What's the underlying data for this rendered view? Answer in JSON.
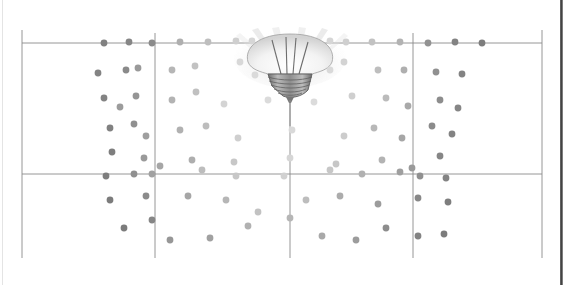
{
  "figure": {
    "kind": "scanned-diagram",
    "caption_text": "",
    "background_color": "#ffffff",
    "ink_color": "#6b6b6b",
    "grid": {
      "line_color": "#8a8a8a",
      "x_lines": [
        22,
        155,
        290,
        413,
        542
      ],
      "y_lines": [
        43,
        174,
        258
      ],
      "left": 22,
      "right": 542,
      "top": 43,
      "bottom": 258
    },
    "lamp": {
      "name": "light-bulb",
      "orientation": "inverted",
      "center_x": 290,
      "glass_top_y": 33,
      "base_top_y": 72,
      "base_bottom_y": 96,
      "stem_bottom_y": 124,
      "glass_color": "#d8d8d8",
      "base_color": "#8f8f8f",
      "ray_color": "#c9c9c9",
      "ray_count": 5
    },
    "illumination": {
      "description": "dot darkness increases with distance from the lamp axis",
      "near_color": "#e8e8e8",
      "far_color": "#6a6a6a",
      "dot_radius": 3.4
    }
  },
  "chart_data": {
    "type": "scatter",
    "title": "",
    "xlabel": "",
    "ylabel": "",
    "grid": true,
    "legend": null,
    "xlim": [
      22,
      542
    ],
    "ylim": [
      43,
      258
    ],
    "note": "x,y are pixel positions on the grid; v is the rendered dot darkness 0 (lightest, near lamp) to 1 (darkest, far from lamp)",
    "points": [
      {
        "x": 104,
        "y": 43,
        "v": 0.82
      },
      {
        "x": 129,
        "y": 42,
        "v": 0.78
      },
      {
        "x": 152,
        "y": 43,
        "v": 0.74
      },
      {
        "x": 180,
        "y": 42,
        "v": 0.45
      },
      {
        "x": 208,
        "y": 42,
        "v": 0.33
      },
      {
        "x": 236,
        "y": 41,
        "v": 0.2
      },
      {
        "x": 252,
        "y": 41,
        "v": 0.14
      },
      {
        "x": 330,
        "y": 41,
        "v": 0.14
      },
      {
        "x": 346,
        "y": 42,
        "v": 0.2
      },
      {
        "x": 372,
        "y": 42,
        "v": 0.3
      },
      {
        "x": 400,
        "y": 42,
        "v": 0.42
      },
      {
        "x": 428,
        "y": 43,
        "v": 0.68
      },
      {
        "x": 455,
        "y": 42,
        "v": 0.8
      },
      {
        "x": 482,
        "y": 43,
        "v": 0.85
      },
      {
        "x": 98,
        "y": 73,
        "v": 0.8
      },
      {
        "x": 126,
        "y": 70,
        "v": 0.75
      },
      {
        "x": 138,
        "y": 68,
        "v": 0.62
      },
      {
        "x": 172,
        "y": 70,
        "v": 0.4
      },
      {
        "x": 195,
        "y": 66,
        "v": 0.3
      },
      {
        "x": 240,
        "y": 62,
        "v": 0.13
      },
      {
        "x": 255,
        "y": 75,
        "v": 0.11
      },
      {
        "x": 330,
        "y": 70,
        "v": 0.12
      },
      {
        "x": 344,
        "y": 62,
        "v": 0.17
      },
      {
        "x": 378,
        "y": 70,
        "v": 0.33
      },
      {
        "x": 404,
        "y": 70,
        "v": 0.45
      },
      {
        "x": 436,
        "y": 72,
        "v": 0.7
      },
      {
        "x": 462,
        "y": 74,
        "v": 0.8
      },
      {
        "x": 104,
        "y": 98,
        "v": 0.8
      },
      {
        "x": 120,
        "y": 107,
        "v": 0.6
      },
      {
        "x": 136,
        "y": 96,
        "v": 0.66
      },
      {
        "x": 172,
        "y": 100,
        "v": 0.42
      },
      {
        "x": 196,
        "y": 92,
        "v": 0.32
      },
      {
        "x": 224,
        "y": 104,
        "v": 0.16
      },
      {
        "x": 268,
        "y": 100,
        "v": 0.1
      },
      {
        "x": 314,
        "y": 102,
        "v": 0.1
      },
      {
        "x": 352,
        "y": 96,
        "v": 0.2
      },
      {
        "x": 386,
        "y": 98,
        "v": 0.36
      },
      {
        "x": 408,
        "y": 106,
        "v": 0.5
      },
      {
        "x": 440,
        "y": 100,
        "v": 0.72
      },
      {
        "x": 458,
        "y": 108,
        "v": 0.78
      },
      {
        "x": 110,
        "y": 128,
        "v": 0.82
      },
      {
        "x": 134,
        "y": 124,
        "v": 0.7
      },
      {
        "x": 146,
        "y": 136,
        "v": 0.58
      },
      {
        "x": 180,
        "y": 130,
        "v": 0.44
      },
      {
        "x": 206,
        "y": 126,
        "v": 0.34
      },
      {
        "x": 238,
        "y": 138,
        "v": 0.2
      },
      {
        "x": 292,
        "y": 130,
        "v": 0.12
      },
      {
        "x": 344,
        "y": 136,
        "v": 0.22
      },
      {
        "x": 374,
        "y": 128,
        "v": 0.38
      },
      {
        "x": 402,
        "y": 138,
        "v": 0.52
      },
      {
        "x": 432,
        "y": 126,
        "v": 0.74
      },
      {
        "x": 452,
        "y": 134,
        "v": 0.8
      },
      {
        "x": 112,
        "y": 152,
        "v": 0.84
      },
      {
        "x": 144,
        "y": 158,
        "v": 0.62
      },
      {
        "x": 160,
        "y": 166,
        "v": 0.52
      },
      {
        "x": 192,
        "y": 160,
        "v": 0.46
      },
      {
        "x": 234,
        "y": 162,
        "v": 0.26
      },
      {
        "x": 290,
        "y": 158,
        "v": 0.14
      },
      {
        "x": 336,
        "y": 164,
        "v": 0.26
      },
      {
        "x": 382,
        "y": 160,
        "v": 0.42
      },
      {
        "x": 412,
        "y": 168,
        "v": 0.62
      },
      {
        "x": 440,
        "y": 156,
        "v": 0.78
      },
      {
        "x": 106,
        "y": 176,
        "v": 0.84
      },
      {
        "x": 134,
        "y": 174,
        "v": 0.7
      },
      {
        "x": 152,
        "y": 174,
        "v": 0.56
      },
      {
        "x": 202,
        "y": 170,
        "v": 0.34
      },
      {
        "x": 236,
        "y": 176,
        "v": 0.26
      },
      {
        "x": 284,
        "y": 176,
        "v": 0.18
      },
      {
        "x": 330,
        "y": 170,
        "v": 0.26
      },
      {
        "x": 362,
        "y": 174,
        "v": 0.44
      },
      {
        "x": 400,
        "y": 172,
        "v": 0.58
      },
      {
        "x": 420,
        "y": 176,
        "v": 0.7
      },
      {
        "x": 446,
        "y": 178,
        "v": 0.8
      },
      {
        "x": 110,
        "y": 200,
        "v": 0.86
      },
      {
        "x": 146,
        "y": 196,
        "v": 0.74
      },
      {
        "x": 188,
        "y": 196,
        "v": 0.52
      },
      {
        "x": 226,
        "y": 200,
        "v": 0.4
      },
      {
        "x": 258,
        "y": 212,
        "v": 0.3
      },
      {
        "x": 306,
        "y": 200,
        "v": 0.34
      },
      {
        "x": 340,
        "y": 196,
        "v": 0.48
      },
      {
        "x": 378,
        "y": 204,
        "v": 0.6
      },
      {
        "x": 418,
        "y": 198,
        "v": 0.76
      },
      {
        "x": 448,
        "y": 202,
        "v": 0.84
      },
      {
        "x": 124,
        "y": 228,
        "v": 0.86
      },
      {
        "x": 152,
        "y": 220,
        "v": 0.78
      },
      {
        "x": 170,
        "y": 240,
        "v": 0.64
      },
      {
        "x": 210,
        "y": 238,
        "v": 0.56
      },
      {
        "x": 248,
        "y": 226,
        "v": 0.44
      },
      {
        "x": 290,
        "y": 218,
        "v": 0.4
      },
      {
        "x": 322,
        "y": 236,
        "v": 0.5
      },
      {
        "x": 356,
        "y": 240,
        "v": 0.6
      },
      {
        "x": 386,
        "y": 228,
        "v": 0.72
      },
      {
        "x": 418,
        "y": 236,
        "v": 0.8
      },
      {
        "x": 444,
        "y": 234,
        "v": 0.86
      }
    ]
  }
}
